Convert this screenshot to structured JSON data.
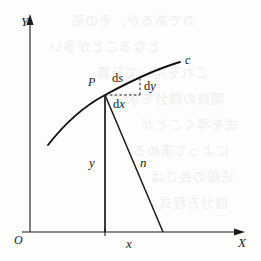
{
  "figure": {
    "kind": "math-diagram",
    "width": 261,
    "height": 261,
    "background_color": "#fdfdfb",
    "ink_color": "#1a1a1a"
  },
  "axes": {
    "y_axis_label": "Y",
    "x_axis_label": "X",
    "origin_label": "O"
  },
  "labels": {
    "curve": "c",
    "point": "P",
    "arc_element": "ds",
    "dy": "dy",
    "dx": "dx",
    "ordinate": "y",
    "normal": "n",
    "abscissa": "x"
  },
  "diff_parts": {
    "d": "d",
    "s": "s",
    "y": "y",
    "x": "x"
  },
  "chart_data": {
    "type": "line",
    "title": "",
    "xlabel": "X",
    "ylabel": "Y",
    "grid": false,
    "legend": null,
    "annotations": [
      {
        "text": "c",
        "role": "curve-name",
        "at": [
          186,
          61
        ]
      },
      {
        "text": "P",
        "role": "point-on-curve",
        "at": [
          105,
          95
        ]
      },
      {
        "text": "ds",
        "role": "arc-differential",
        "at": [
          122,
          80
        ]
      },
      {
        "text": "dy",
        "role": "y-differential",
        "at": [
          145,
          88
        ]
      },
      {
        "text": "dx",
        "role": "x-differential",
        "at": [
          121,
          104
        ]
      },
      {
        "text": "y",
        "role": "ordinate-segment",
        "at": [
          105,
          163
        ]
      },
      {
        "text": "n",
        "role": "normal-segment",
        "at": [
          140,
          163
        ]
      },
      {
        "text": "x",
        "role": "abscissa-tick",
        "at": [
          130,
          242
        ]
      },
      {
        "text": "O",
        "role": "origin",
        "at": [
          18,
          240
        ]
      }
    ],
    "curve_points": [
      [
        48,
        145
      ],
      [
        62,
        128
      ],
      [
        76,
        114
      ],
      [
        90,
        103
      ],
      [
        105,
        95
      ],
      [
        120,
        87
      ],
      [
        136,
        79
      ],
      [
        152,
        72
      ],
      [
        166,
        66
      ],
      [
        180,
        62
      ]
    ],
    "segments": [
      {
        "name": "ordinate",
        "from": [
          105,
          95
        ],
        "to": [
          105,
          232
        ],
        "style": "solid"
      },
      {
        "name": "normal",
        "from": [
          105,
          95
        ],
        "to": [
          163,
          232
        ],
        "style": "solid"
      },
      {
        "name": "dx",
        "from": [
          105,
          95
        ],
        "to": [
          140,
          95
        ],
        "style": "dashed"
      },
      {
        "name": "dy",
        "from": [
          140,
          95
        ],
        "to": [
          140,
          80
        ],
        "style": "dashed"
      }
    ],
    "axis_lines": [
      {
        "name": "y-axis",
        "from": [
          30,
          232
        ],
        "to": [
          30,
          18
        ],
        "arrow": true
      },
      {
        "name": "x-axis",
        "from": [
          22,
          232
        ],
        "to": [
          243,
          232
        ],
        "arrow": true
      }
    ]
  },
  "bleed_through": {
    "note": "faint reversed text showing through from the other side of the page",
    "rows": [
      {
        "text": "のであるが、その形",
        "top": 8,
        "left": 70
      },
      {
        "text": "となることが多い",
        "top": 34,
        "left": 48
      },
      {
        "text": "これを用いて計算",
        "top": 60,
        "left": 96
      },
      {
        "text": "関数の微分を求",
        "top": 86,
        "left": 126
      },
      {
        "text": "式を導くことが",
        "top": 112,
        "left": 140
      },
      {
        "text": "によって求める",
        "top": 138,
        "left": 132
      },
      {
        "text": "法線の長さは",
        "top": 164,
        "left": 150
      },
      {
        "text": "微分方程式",
        "top": 190,
        "left": 158
      }
    ]
  }
}
